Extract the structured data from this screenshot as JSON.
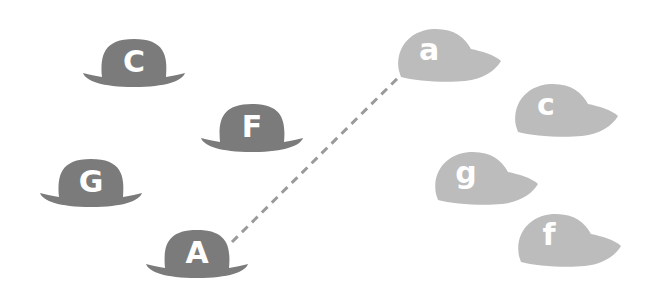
{
  "colors": {
    "bowler": "#7b7b7b",
    "cap": "#bcbcbc",
    "label": "#ffffff",
    "connector": "#9a9a9a",
    "background": "#ffffff"
  },
  "bowler_hats": [
    {
      "id": "C",
      "label": "C",
      "x": 82,
      "y": 37
    },
    {
      "id": "F",
      "label": "F",
      "x": 200,
      "y": 102
    },
    {
      "id": "G",
      "label": "G",
      "x": 39,
      "y": 157
    },
    {
      "id": "A",
      "label": "A",
      "x": 145,
      "y": 228
    }
  ],
  "caps": [
    {
      "id": "a",
      "label": "a",
      "x": 395,
      "y": 27
    },
    {
      "id": "c",
      "label": "c",
      "x": 512,
      "y": 82
    },
    {
      "id": "g",
      "label": "g",
      "x": 432,
      "y": 150
    },
    {
      "id": "f",
      "label": "f",
      "x": 515,
      "y": 212
    }
  ],
  "connections": [
    {
      "from": "A",
      "to": "a",
      "style": "dashed",
      "x1": 232,
      "y1": 242,
      "x2": 412,
      "y2": 64
    }
  ]
}
